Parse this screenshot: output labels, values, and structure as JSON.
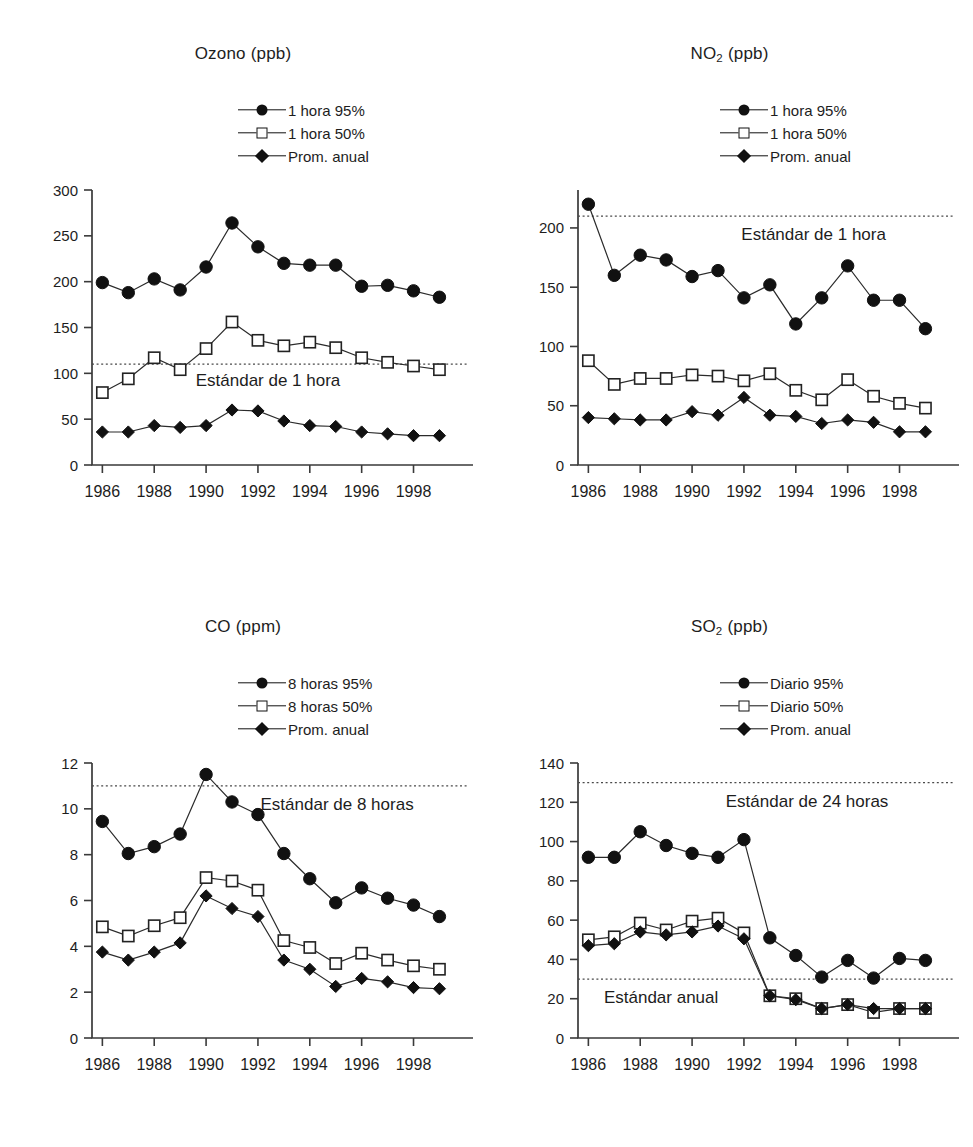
{
  "page": {
    "background": "#ffffff",
    "ink": "#1a1a1a",
    "legend_labels_common": "Prom. anual"
  },
  "legend_symbols": [
    "circle",
    "square",
    "diamond"
  ],
  "chart_data": [
    {
      "id": "ozono",
      "type": "line",
      "title": "Ozono (ppb)",
      "title_main": "Ozono",
      "title_unit": "(ppb)",
      "subscript": "",
      "xlabel": "",
      "ylabel": "",
      "x": [
        1986,
        1987,
        1988,
        1989,
        1990,
        1991,
        1992,
        1993,
        1994,
        1995,
        1996,
        1997,
        1998,
        1999
      ],
      "xlim": [
        1985.6,
        1999.6
      ],
      "xticks": [
        1986,
        1988,
        1990,
        1992,
        1994,
        1996,
        1998
      ],
      "xticklabels": [
        "1986",
        "1988",
        "1990",
        "1992",
        "1994",
        "1996",
        "1998"
      ],
      "yticks": [
        0,
        50,
        100,
        150,
        200,
        250,
        300
      ],
      "yticklabels": [
        "0",
        "50",
        "100",
        "150",
        "200",
        "250",
        "300"
      ],
      "ylim": [
        0,
        300
      ],
      "grid": false,
      "legend_position": "top-right",
      "series": [
        {
          "name": "1 hora 95%",
          "marker": "circle",
          "values": [
            199,
            188,
            203,
            191,
            216,
            264,
            238,
            220,
            218,
            218,
            195,
            196,
            190,
            183
          ]
        },
        {
          "name": "1 hora 50%",
          "marker": "square",
          "values": [
            79,
            94,
            117,
            104,
            127,
            156,
            136,
            130,
            134,
            128,
            117,
            112,
            108,
            104
          ]
        },
        {
          "name": "Prom. anual",
          "marker": "diamond",
          "values": [
            36,
            36,
            43,
            41,
            43,
            60,
            59,
            48,
            43,
            42,
            36,
            34,
            32,
            32
          ]
        }
      ],
      "annotations": [
        {
          "text": "Estándar de 1 hora",
          "value": 110,
          "kind": "standard-line",
          "label_x": 1989.6,
          "label_dy": 22
        }
      ]
    },
    {
      "id": "no2",
      "type": "line",
      "title": "NO2 (ppb)",
      "title_main": "NO",
      "title_unit": "(ppb)",
      "subscript": "2",
      "xlabel": "",
      "ylabel": "",
      "x": [
        1986,
        1987,
        1988,
        1989,
        1990,
        1991,
        1992,
        1993,
        1994,
        1995,
        1996,
        1997,
        1998,
        1999
      ],
      "xlim": [
        1985.6,
        1999.6
      ],
      "xticks": [
        1986,
        1988,
        1990,
        1992,
        1994,
        1996,
        1998
      ],
      "xticklabels": [
        "1986",
        "1988",
        "1990",
        "1992",
        "1994",
        "1996",
        "1998"
      ],
      "yticks": [
        0,
        50,
        100,
        150,
        200
      ],
      "yticklabels": [
        "0",
        "50",
        "100",
        "150",
        "200"
      ],
      "ylim": [
        0,
        232
      ],
      "grid": false,
      "legend_position": "top-right",
      "series": [
        {
          "name": "1 hora 95%",
          "marker": "circle",
          "values": [
            220,
            160,
            177,
            173,
            159,
            164,
            141,
            152,
            119,
            141,
            168,
            139,
            139,
            115
          ]
        },
        {
          "name": "1 hora 50%",
          "marker": "square",
          "values": [
            88,
            68,
            73,
            73,
            76,
            75,
            71,
            77,
            63,
            55,
            72,
            58,
            52,
            48
          ]
        },
        {
          "name": "Prom. anual",
          "marker": "diamond",
          "values": [
            40,
            39,
            38,
            38,
            45,
            42,
            57,
            42,
            41,
            35,
            38,
            36,
            28,
            28
          ]
        }
      ],
      "annotations": [
        {
          "text": "Estándar de 1 hora",
          "value": 210,
          "kind": "standard-line",
          "label_x": 1991.9,
          "label_dy": 24
        }
      ]
    },
    {
      "id": "co",
      "type": "line",
      "title": "CO (ppm)",
      "title_main": "CO",
      "title_unit": "(ppm)",
      "subscript": "",
      "xlabel": "",
      "ylabel": "",
      "x": [
        1986,
        1987,
        1988,
        1989,
        1990,
        1991,
        1992,
        1993,
        1994,
        1995,
        1996,
        1997,
        1998,
        1999
      ],
      "xlim": [
        1985.6,
        1999.6
      ],
      "xticks": [
        1986,
        1988,
        1990,
        1992,
        1994,
        1996,
        1998
      ],
      "xticklabels": [
        "1986",
        "1988",
        "1990",
        "1992",
        "1994",
        "1996",
        "1998"
      ],
      "yticks": [
        0,
        2,
        4,
        6,
        8,
        10,
        12
      ],
      "yticklabels": [
        "0",
        "2",
        "4",
        "6",
        "8",
        "10",
        "12"
      ],
      "ylim": [
        0,
        12
      ],
      "grid": false,
      "legend_position": "top-right",
      "series": [
        {
          "name": "8 horas 95%",
          "marker": "circle",
          "values": [
            9.45,
            8.05,
            8.35,
            8.9,
            11.5,
            10.3,
            9.75,
            8.05,
            6.95,
            5.9,
            6.55,
            6.1,
            5.8,
            5.3
          ]
        },
        {
          "name": "8 horas 50%",
          "marker": "square",
          "values": [
            4.85,
            4.45,
            4.9,
            5.25,
            7.0,
            6.85,
            6.45,
            4.25,
            3.95,
            3.25,
            3.7,
            3.4,
            3.15,
            3.0
          ]
        },
        {
          "name": "Prom. anual",
          "marker": "diamond",
          "values": [
            3.75,
            3.4,
            3.75,
            4.15,
            6.2,
            5.65,
            5.3,
            3.4,
            3.0,
            2.25,
            2.6,
            2.45,
            2.2,
            2.15
          ]
        }
      ],
      "annotations": [
        {
          "text": "Estándar de 8 horas",
          "value": 11.0,
          "kind": "standard-line",
          "label_x": 1992.1,
          "label_dy": 24
        }
      ]
    },
    {
      "id": "so2",
      "type": "line",
      "title": "SO2 (ppb)",
      "title_main": "SO",
      "title_unit": "(ppb)",
      "subscript": "2",
      "xlabel": "",
      "ylabel": "",
      "x": [
        1986,
        1987,
        1988,
        1989,
        1990,
        1991,
        1992,
        1993,
        1994,
        1995,
        1996,
        1997,
        1998,
        1999
      ],
      "xlim": [
        1985.6,
        1999.6
      ],
      "xticks": [
        1986,
        1988,
        1990,
        1992,
        1994,
        1996,
        1998
      ],
      "xticklabels": [
        "1986",
        "1988",
        "1990",
        "1992",
        "1994",
        "1996",
        "1998"
      ],
      "yticks": [
        0,
        20,
        40,
        60,
        80,
        100,
        120,
        140
      ],
      "yticklabels": [
        "0",
        "20",
        "40",
        "60",
        "80",
        "100",
        "120",
        "140"
      ],
      "ylim": [
        0,
        140
      ],
      "grid": false,
      "legend_position": "top-right",
      "series": [
        {
          "name": "Diario 95%",
          "marker": "circle",
          "values": [
            92,
            92,
            105,
            98,
            94,
            92,
            101,
            51,
            42,
            31,
            39.5,
            30.5,
            40.5,
            39.5
          ]
        },
        {
          "name": "Diario 50%",
          "marker": "square",
          "values": [
            50,
            51.5,
            58.5,
            55,
            59.5,
            61,
            53.5,
            21.5,
            20,
            15,
            17,
            13,
            15,
            15
          ]
        },
        {
          "name": "Prom. anual",
          "marker": "diamond",
          "values": [
            47,
            48,
            54,
            52.5,
            54,
            57,
            50.5,
            21.5,
            19.5,
            15,
            17,
            15,
            15,
            15
          ]
        }
      ],
      "annotations": [
        {
          "text": "Estándar de 24 horas",
          "value": 130,
          "kind": "standard-line",
          "label_x": 1991.3,
          "label_dy": 24
        },
        {
          "text": "Estándar anual",
          "value": 30,
          "kind": "standard-line",
          "label_x": 1986.6,
          "label_dy": 24
        }
      ]
    }
  ]
}
